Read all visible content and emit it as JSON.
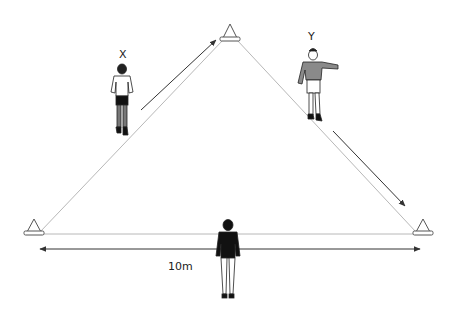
{
  "diagram": {
    "type": "drill-diagram",
    "labels": {
      "player_x": "X",
      "player_y": "Y",
      "distance": "10m"
    },
    "cones": [
      {
        "id": "top",
        "apex": [
          230,
          24
        ]
      },
      {
        "id": "left",
        "apex": [
          34,
          218
        ]
      },
      {
        "id": "right",
        "apex": [
          423,
          219
        ]
      }
    ],
    "players": [
      {
        "id": "x",
        "label": "X",
        "shirt_color": "#ffffff",
        "shorts_color": "#111111",
        "socks_color": "#777777"
      },
      {
        "id": "y",
        "label": "Y",
        "shirt_color": "#8a8a8a",
        "shorts_color": "#ffffff",
        "socks_color": "#ffffff"
      },
      {
        "id": "coach",
        "label": "",
        "shirt_color": "#111111",
        "shorts_color": "#ffffff"
      }
    ],
    "arrows": [
      {
        "id": "x-run",
        "from": [
          141,
          110
        ],
        "to": [
          216,
          40
        ]
      },
      {
        "id": "y-run",
        "from": [
          333,
          131
        ],
        "to": [
          405,
          206
        ]
      },
      {
        "id": "distance",
        "from": [
          40,
          249
        ],
        "to": [
          420,
          249
        ],
        "double": true
      }
    ],
    "colors": {
      "line": "#b5b5b5",
      "arrow": "#333333",
      "cone_stroke": "#555555"
    }
  }
}
